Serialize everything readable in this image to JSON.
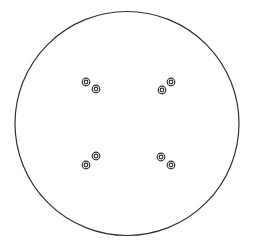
{
  "canvas": {
    "width": 256,
    "height": 243,
    "background": "#ffffff"
  },
  "stroke_color": "#333333",
  "plate": {
    "cx": 127,
    "cy": 123.5,
    "r": 112,
    "stroke_width": 1.2
  },
  "hole_style": {
    "outer_r": 3.8,
    "inner_r": 1.8,
    "stroke_width": 1.2
  },
  "hole_groups": [
    {
      "name": "top-left",
      "holes": [
        {
          "cx": 86,
          "cy": 82
        },
        {
          "cx": 96,
          "cy": 89
        }
      ]
    },
    {
      "name": "top-right",
      "holes": [
        {
          "cx": 171,
          "cy": 82
        },
        {
          "cx": 162,
          "cy": 90
        }
      ]
    },
    {
      "name": "bottom-left",
      "holes": [
        {
          "cx": 96,
          "cy": 156
        },
        {
          "cx": 86,
          "cy": 165
        }
      ]
    },
    {
      "name": "bottom-right",
      "holes": [
        {
          "cx": 161,
          "cy": 157
        },
        {
          "cx": 171,
          "cy": 165
        }
      ]
    }
  ]
}
